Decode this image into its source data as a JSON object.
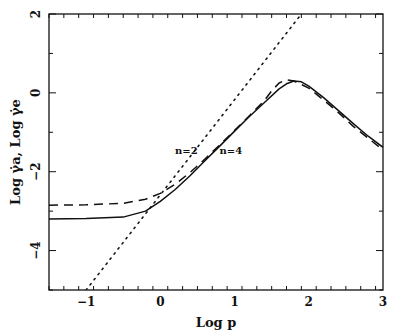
{
  "chart_data": {
    "type": "line",
    "title": "",
    "xlabel": "Log p",
    "ylabel": "Log γ̇a,  Log γ̇e",
    "xlim": [
      -1.5,
      3
    ],
    "ylim": [
      -5,
      2
    ],
    "xticks": [
      -1,
      0,
      1,
      2,
      3
    ],
    "xtick_labels": [
      "−1",
      "0",
      "1",
      "2",
      "3"
    ],
    "yticks": [
      -4,
      -2,
      0,
      2
    ],
    "ytick_labels": [
      "−4",
      "−2",
      "0",
      "2"
    ],
    "grid": false,
    "series": [
      {
        "name": "n=4",
        "style": "solid",
        "x": [
          -1.5,
          -1.0,
          -0.5,
          -0.2,
          0.0,
          0.2,
          0.4,
          0.6,
          0.8,
          1.0,
          1.2,
          1.4,
          1.6,
          1.7,
          1.8,
          1.9,
          2.0,
          2.2,
          2.4,
          2.6,
          2.8,
          3.0
        ],
        "y": [
          -3.2,
          -3.19,
          -3.15,
          -3.0,
          -2.75,
          -2.45,
          -2.1,
          -1.72,
          -1.35,
          -0.97,
          -0.6,
          -0.25,
          0.1,
          0.23,
          0.3,
          0.28,
          0.17,
          -0.12,
          -0.45,
          -0.78,
          -1.1,
          -1.38
        ]
      },
      {
        "name": "n=2",
        "style": "dashed",
        "x": [
          -1.5,
          -1.0,
          -0.5,
          -0.2,
          0.0,
          0.2,
          0.4,
          0.6,
          0.8,
          1.0,
          1.2,
          1.4,
          1.5,
          1.6,
          1.7,
          1.8,
          2.0,
          2.2,
          2.4,
          2.6,
          2.8,
          3.0
        ],
        "y": [
          -2.85,
          -2.84,
          -2.8,
          -2.7,
          -2.55,
          -2.32,
          -2.02,
          -1.68,
          -1.32,
          -0.95,
          -0.58,
          -0.2,
          0.05,
          0.25,
          0.33,
          0.3,
          0.12,
          -0.18,
          -0.5,
          -0.85,
          -1.15,
          -1.45
        ]
      },
      {
        "name": "asymptote",
        "style": "dotted",
        "x": [
          -1.0,
          1.9
        ],
        "y": [
          -5.0,
          2.0
        ]
      }
    ],
    "annotations": [
      {
        "text": "n=2",
        "x": 0.35,
        "y": -1.55
      },
      {
        "text": "n=4",
        "x": 0.95,
        "y": -1.55
      }
    ]
  }
}
